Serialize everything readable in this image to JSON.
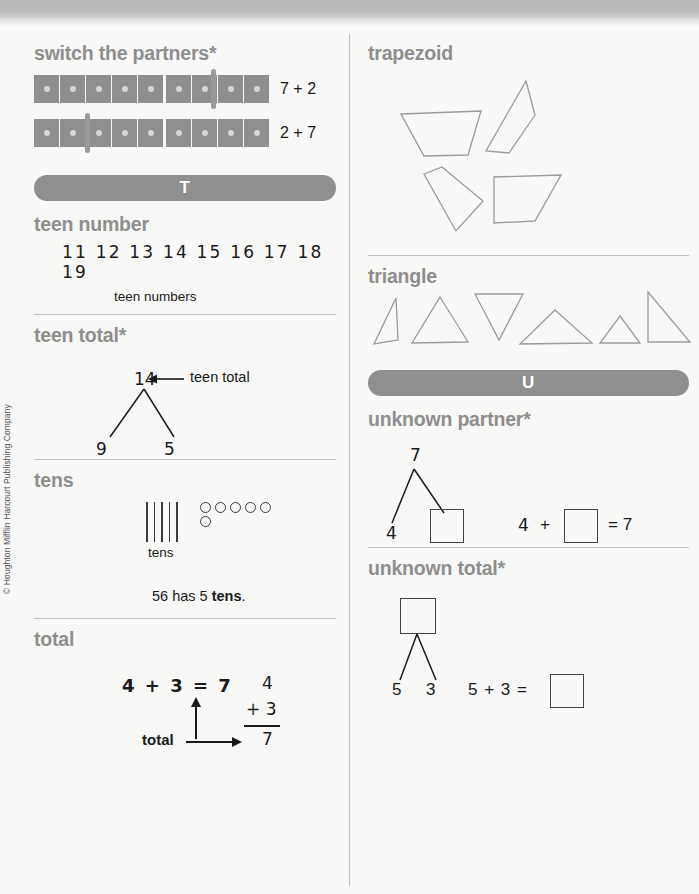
{
  "page": {
    "copyright": "© Houghton Mifflin Harcourt Publishing Company",
    "accent_gray": "#8f8f8f",
    "heading_gray": "#8e8e8e",
    "ink": "#1a1a1a"
  },
  "left_column": {
    "entries": [
      {
        "id": "switch-the-partners",
        "term": "switch the partners*",
        "bars": [
          {
            "cells": 9,
            "split_after": 5,
            "marker_after": 7,
            "equation": "7 + 2"
          },
          {
            "cells": 9,
            "split_after": 5,
            "marker_after": 2,
            "equation": "2 + 7"
          }
        ]
      },
      {
        "id": "section-banner-t",
        "banner_letter": "T"
      },
      {
        "id": "teen-number",
        "term": "teen number",
        "numbers": "11  12  13  14  15  16  17  18  19",
        "caption": "teen numbers"
      },
      {
        "id": "teen-total",
        "term": "teen total*",
        "total": "14",
        "arrow_label": "teen total",
        "partner_left": "9",
        "partner_right": "5"
      },
      {
        "id": "tens",
        "term": "tens",
        "sticks": 5,
        "circles_top_row": 5,
        "circles_bottom_row": 1,
        "picture_label": "tens",
        "sentence_prefix": "56 has 5 ",
        "sentence_bold": "tens",
        "sentence_suffix": "."
      },
      {
        "id": "total",
        "term": "total",
        "equation": "4 + 3 = 7",
        "arrow_label": "total",
        "vertical": {
          "top": "4",
          "plus_addend": "+ 3",
          "sum": "7"
        }
      }
    ]
  },
  "right_column": {
    "entries": [
      {
        "id": "trapezoid",
        "term": "trapezoid",
        "shape_count": 4,
        "shape_type": "trapezoid"
      },
      {
        "id": "triangle",
        "term": "triangle",
        "shape_count": 6,
        "shape_type": "triangle"
      },
      {
        "id": "section-banner-u",
        "banner_letter": "U"
      },
      {
        "id": "unknown-partner",
        "term": "unknown partner*",
        "total": "7",
        "known_partner": "4",
        "unknown_partner_box": "",
        "equation_left": "4",
        "equation_plus": "+",
        "equation_equals": "= 7"
      },
      {
        "id": "unknown-total",
        "term": "unknown total*",
        "unknown_total_box": "",
        "partner_left": "5",
        "partner_right": "3",
        "equation_text": "5 + 3 ="
      }
    ]
  }
}
